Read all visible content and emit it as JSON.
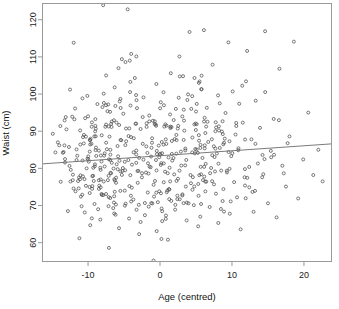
{
  "figure": {
    "background_color": "#ffffff",
    "point_color": "#4d4d4d",
    "line_color": "#6b6b6b",
    "frame_color": "#9a9a9a"
  },
  "chart_data": {
    "type": "scatter",
    "title": "",
    "subtitle": "",
    "xlabel": "Age (centred)",
    "ylabel": "Waist (cm)",
    "xlim": [
      -16.4,
      23.9
    ],
    "ylim": [
      54.8,
      124.5
    ],
    "xticks": [
      -10,
      0,
      10,
      20
    ],
    "xtick_labels": [
      "-10",
      "0",
      "10",
      "20"
    ],
    "yticks": [
      60,
      70,
      80,
      90,
      100,
      110,
      120
    ],
    "ytick_labels": [
      "60",
      "70",
      "80",
      "90",
      "100",
      "110",
      "120"
    ],
    "grid": false,
    "legend": null,
    "marker": "open-circle",
    "marker_size": 3,
    "n_points": 520,
    "annotations": [],
    "trend_line": {
      "type": "linear-fit",
      "x_start": -16.4,
      "y_start": 81.2,
      "x_end": 23.9,
      "y_end": 86.6,
      "slope": 0.134,
      "intercept": 83.4
    },
    "x": [
      -13.2,
      -12.1,
      -11.6,
      -11.3,
      -11.1,
      -10.9,
      -10.7,
      -10.5,
      -10.4,
      -10.2,
      -14.9,
      -14.2,
      -13.8,
      -13.5,
      -13.1,
      -12.8,
      -12.4,
      -12.0,
      -11.8,
      -11.5,
      -11.2,
      -10.8,
      -10.6,
      -10.3,
      -10.1,
      -9.9,
      -9.7,
      -9.5,
      -9.3,
      -9.1,
      -8.9,
      -8.7,
      -8.5,
      -8.3,
      -8.1,
      -7.9,
      -7.7,
      -7.5,
      -7.3,
      -7.1,
      -6.9,
      -6.7,
      -6.5,
      -6.3,
      -6.1,
      -5.9,
      -5.7,
      -5.5,
      -5.3,
      -5.1,
      -4.9,
      -4.7,
      -4.5,
      -4.3,
      -4.1,
      -3.9,
      -3.7,
      -3.5,
      -3.3,
      -3.1,
      -2.9,
      -2.7,
      -2.5,
      -2.3,
      -2.1,
      -1.9,
      -1.7,
      -1.5,
      -1.3,
      -1.1,
      -0.9,
      -0.7,
      -0.5,
      -0.3,
      -0.1,
      0.1,
      0.3,
      0.5,
      0.7,
      0.9,
      1.1,
      1.3,
      1.5,
      1.7,
      1.9,
      2.1,
      2.3,
      2.5,
      2.7,
      2.9,
      3.1,
      3.3,
      3.5,
      3.7,
      3.9,
      4.1,
      4.3,
      4.5,
      4.7,
      4.9,
      5.1,
      5.3,
      5.5,
      5.7,
      5.9,
      6.1,
      6.3,
      6.5,
      6.7,
      6.9,
      7.1,
      7.3,
      7.5,
      7.7,
      7.9,
      8.1,
      8.3,
      8.5,
      8.7,
      8.9,
      9.1,
      9.3,
      9.5,
      9.7,
      9.9,
      10.1,
      10.3,
      10.5,
      10.7,
      10.9,
      11.2,
      11.5,
      11.8,
      12.1,
      12.4,
      12.7,
      13.0,
      13.3,
      13.6,
      13.9,
      14.2,
      14.6,
      15.0,
      15.4,
      15.8,
      16.2,
      16.6,
      17.0,
      17.5,
      18.0,
      18.6,
      19.2,
      19.9,
      20.6,
      21.3,
      22.0,
      22.6,
      -8.0,
      -4.2,
      -7.5,
      -11.9,
      -13.0,
      -9.4,
      -6.2,
      -3.4,
      -0.6,
      2.2,
      5.0,
      7.8,
      10.6,
      -12.5,
      -10.0,
      -7.8,
      -5.6,
      -3.2,
      -1.0,
      1.4,
      3.8,
      6.2,
      8.6,
      -14.0,
      -12.2,
      -9.8,
      -7.2,
      -4.8,
      -2.4,
      0.2,
      2.6,
      5.4,
      8.2,
      -13.4,
      -11.0,
      -8.6,
      -6.4,
      -4.0,
      -1.6,
      0.8,
      3.2,
      5.6,
      9.0
    ],
    "y": [
      82.5,
      78.3,
      85.1,
      74.6,
      90.2,
      69.8,
      88.4,
      77.1,
      93.5,
      80.0,
      89.3,
      87.0,
      76.4,
      84.2,
      93.8,
      68.5,
      79.6,
      113.8,
      96.1,
      83.4,
      61.2,
      72.9,
      86.7,
      75.3,
      99.5,
      81.8,
      64.7,
      91.2,
      78.0,
      70.4,
      85.6,
      97.3,
      76.8,
      66.2,
      88.9,
      123.9,
      80.5,
      73.1,
      95.4,
      58.6,
      83.7,
      92.6,
      69.3,
      101.8,
      77.5,
      86.0,
      63.9,
      79.2,
      109.4,
      94.7,
      74.0,
      87.3,
      122.8,
      66.5,
      96.9,
      81.0,
      71.6,
      104.3,
      84.8,
      76.1,
      62.3,
      90.6,
      78.7,
      99.1,
      67.4,
      85.9,
      73.5,
      94.2,
      80.3,
      88.1,
      55.2,
      76.6,
      102.7,
      70.9,
      83.0,
      97.8,
      65.8,
      86.4,
      79.1,
      91.5,
      60.8,
      74.3,
      105.6,
      82.1,
      93.0,
      68.9,
      87.6,
      77.2,
      110.1,
      84.5,
      72.7,
      95.8,
      80.8,
      66.0,
      99.9,
      116.7,
      76.0,
      88.3,
      70.1,
      85.2,
      91.9,
      64.4,
      103.4,
      78.4,
      82.8,
      117.2,
      73.8,
      96.3,
      87.1,
      69.6,
      80.1,
      107.9,
      75.7,
      90.0,
      84.0,
      65.3,
      97.5,
      79.4,
      71.2,
      86.9,
      94.9,
      78.9,
      113.9,
      67.8,
      83.3,
      100.7,
      76.3,
      89.1,
      72.2,
      85.4,
      63.6,
      92.3,
      79.8,
      111.6,
      74.9,
      87.8,
      68.3,
      98.2,
      81.3,
      90.9,
      77.6,
      116.9,
      70.6,
      84.7,
      93.3,
      66.8,
      106.8,
      80.7,
      75.1,
      88.6,
      114.1,
      71.9,
      82.4,
      95.0,
      78.2,
      85.0,
      76.5,
      96.5,
      109.0,
      97.0,
      93.2,
      90.5,
      77.9,
      96.8,
      92.0,
      91.8,
      96.0,
      95.3,
      91.0,
      91.4,
      101.2,
      94.0,
      97.6,
      98.0,
      96.2,
      92.8,
      94.5,
      98.4,
      93.6,
      89.9,
      86.2,
      93.9,
      75.0,
      97.2,
      108.6,
      86.6,
      61.0,
      99.0,
      103.0,
      90.2,
      84.4,
      72.4,
      69.0,
      70.8,
      110.8,
      78.6,
      66.4,
      104.8,
      67.0,
      88.0
    ]
  }
}
